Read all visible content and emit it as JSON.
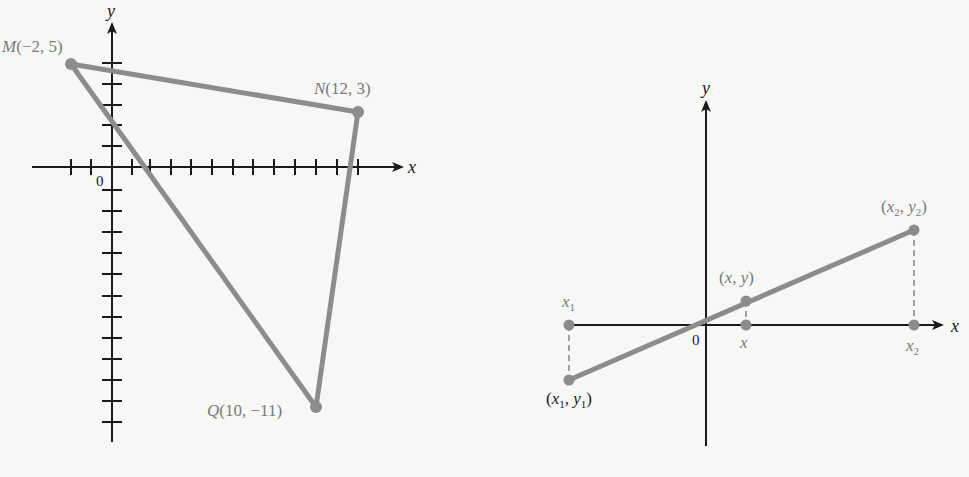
{
  "left_figure": {
    "axes": {
      "x_label": "x",
      "y_label": "y",
      "origin_label": "0"
    },
    "points": [
      {
        "name": "M",
        "x": -2,
        "y": 5,
        "label_name": "M",
        "label_coords": "(−2, 5)"
      },
      {
        "name": "N",
        "x": 12,
        "y": 3,
        "label_name": "N",
        "label_coords": "(12, 3)"
      },
      {
        "name": "Q",
        "x": 10,
        "y": -11,
        "label_name": "Q",
        "label_coords": "(10, −11)"
      }
    ],
    "segments": [
      [
        "M",
        "N"
      ],
      [
        "N",
        "Q"
      ],
      [
        "Q",
        "M"
      ]
    ],
    "x_ticks": [
      -4,
      -3,
      -2,
      -1,
      1,
      2,
      3,
      4,
      5,
      6,
      7,
      8,
      9,
      10,
      11,
      12,
      13
    ],
    "y_ticks": [
      6,
      5,
      4,
      3,
      2,
      1,
      -1,
      -2,
      -3,
      -4,
      -5,
      -6,
      -7,
      -8,
      -9,
      -10,
      -11,
      -12
    ]
  },
  "right_figure": {
    "axes": {
      "x_label": "x",
      "y_label": "y",
      "origin_label": "0"
    },
    "labels": {
      "p1_open": "(",
      "p1_x": "x",
      "p1_x_sub": "1",
      "p1_sep": ", ",
      "p1_y": "y",
      "p1_y_sub": "1",
      "p1_close": ")",
      "p_open": "(",
      "p_x": "x",
      "p_sep": ", ",
      "p_y": "y",
      "p_close": ")",
      "p2_open": "(",
      "p2_x": "x",
      "p2_x_sub": "2",
      "p2_sep": ", ",
      "p2_y": "y",
      "p2_y_sub": "2",
      "p2_close": ")",
      "x1_base": "x",
      "x1_sub": "1",
      "x_base": "x",
      "x2_base": "x",
      "x2_sub": "2"
    }
  },
  "colors": {
    "segment": "#8c8c8c",
    "axis": "#1a1a1a",
    "label": "#7a7a7a",
    "background": "#f7f7f5"
  }
}
